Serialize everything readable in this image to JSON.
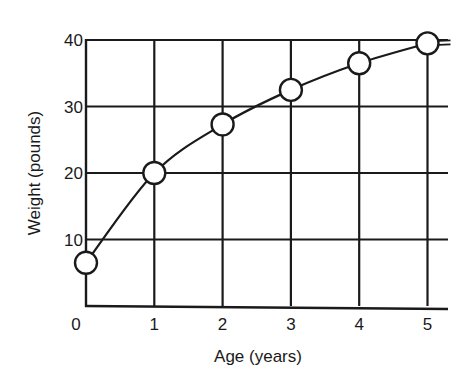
{
  "chart_data": {
    "type": "line",
    "title": "",
    "xlabel": "Age (years)",
    "ylabel": "Weight (pounds)",
    "x": [
      0,
      1,
      2,
      3,
      4,
      5
    ],
    "series": [
      {
        "name": "Weight",
        "values": [
          6.5,
          20,
          27.3,
          32.5,
          36.5,
          39.5
        ],
        "markers": "open-circle",
        "smooth": true
      }
    ],
    "x_ticks": [
      "0",
      "1",
      "2",
      "3",
      "4",
      "5"
    ],
    "y_ticks": [
      "10",
      "20",
      "30",
      "40"
    ],
    "xlim": [
      0,
      5.3
    ],
    "ylim": [
      0,
      40
    ],
    "grid": true,
    "legend": null
  },
  "colors": {
    "line": "#1a1a1a",
    "background": "#ffffff",
    "marker_fill": "#ffffff"
  }
}
